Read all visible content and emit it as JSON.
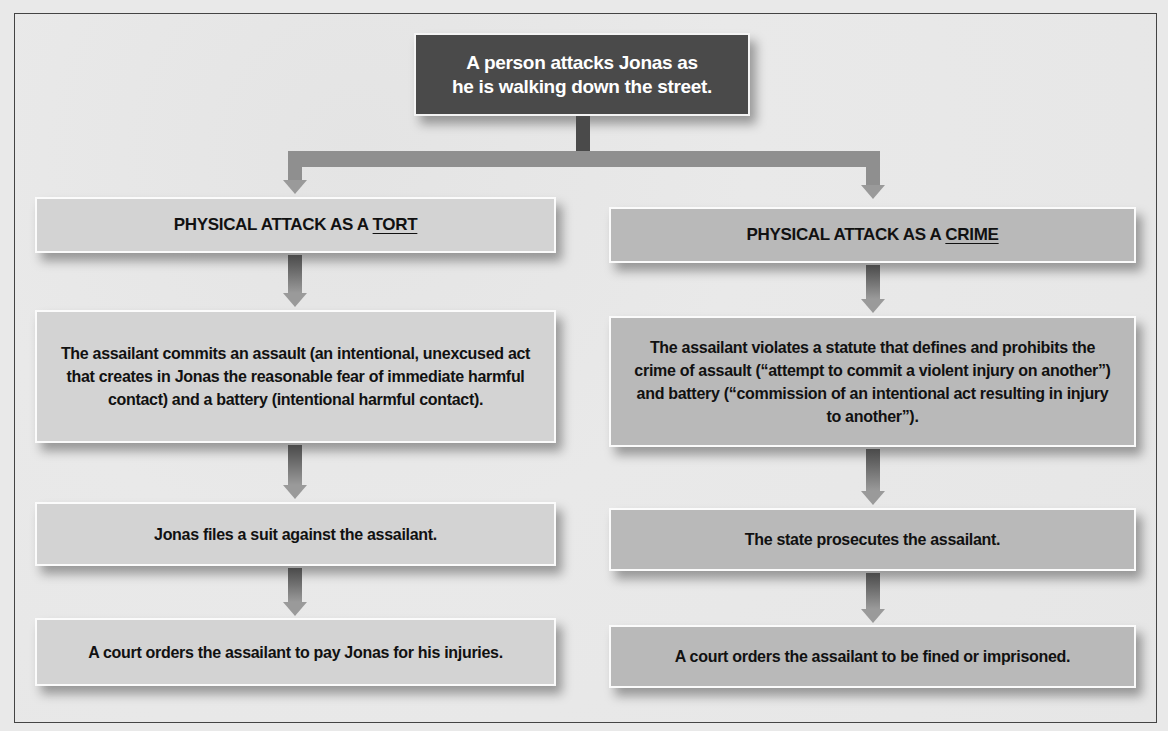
{
  "diagram": {
    "top": {
      "line1": "A person attacks Jonas as",
      "line2": "he is walking down the street."
    },
    "tort": {
      "header_prefix": "PHYSICAL ATTACK AS A ",
      "header_keyword": "TORT",
      "steps": [
        "The assailant commits an assault (an intentional, unexcused act that creates in Jonas the reasonable fear of immediate harmful contact) and a battery (intentional harmful contact).",
        "Jonas files a suit against the assailant.",
        "A court orders the assailant to pay Jonas for his injuries."
      ]
    },
    "crime": {
      "header_prefix": "PHYSICAL ATTACK AS A ",
      "header_keyword": "CRIME",
      "steps": [
        "The assailant violates a statute that defines and prohibits the crime of assault (“attempt to commit a violent injury on another”) and battery (“commission of an intentional act resulting in injury to another”).",
        "The state prosecutes the assailant.",
        "A court orders the assailant to be fined or imprisoned."
      ]
    },
    "colors": {
      "top_box": "#4a4a4a",
      "tort_boxes": "#d3d3d3",
      "crime_boxes": "#b9b9b9",
      "arrows": "#9a9a9a"
    }
  }
}
